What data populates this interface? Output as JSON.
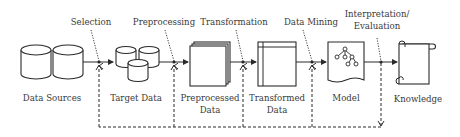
{
  "diagram": {
    "nodes": [
      {
        "id": "data_sources",
        "label": "Data Sources",
        "icon": "databases-icon"
      },
      {
        "id": "target_data",
        "label": "Target Data",
        "icon": "database-cluster-icon"
      },
      {
        "id": "preprocessed_data",
        "label_line1": "Preprocessed",
        "label_line2": "Data",
        "icon": "stacked-pages-icon"
      },
      {
        "id": "transformed_data",
        "label_line1": "Transformed",
        "label_line2": "Data",
        "icon": "table-page-icon"
      },
      {
        "id": "model",
        "label": "Model",
        "icon": "tree-document-icon"
      },
      {
        "id": "knowledge",
        "label": "Knowledge",
        "icon": "scroll-icon"
      }
    ],
    "steps": [
      {
        "id": "selection",
        "label": "Selection"
      },
      {
        "id": "preprocessing",
        "label": "Preprocessing"
      },
      {
        "id": "transformation",
        "label": "Transformation"
      },
      {
        "id": "data_mining",
        "label": "Data Mining"
      },
      {
        "id": "interpretation",
        "label_line1": "Interpretation/",
        "label_line2": "Evaluation"
      }
    ],
    "edges": [
      {
        "from": "data_sources",
        "to": "target_data",
        "via": "selection"
      },
      {
        "from": "target_data",
        "to": "preprocessed_data",
        "via": "preprocessing"
      },
      {
        "from": "preprocessed_data",
        "to": "transformed_data",
        "via": "transformation"
      },
      {
        "from": "transformed_data",
        "to": "model",
        "via": "data_mining"
      },
      {
        "from": "model",
        "to": "knowledge",
        "via": "interpretation"
      }
    ],
    "feedback": {
      "from": "interpretation",
      "to": [
        "selection",
        "preprocessing",
        "transformation",
        "data_mining"
      ],
      "style": "dashed"
    },
    "colors": {
      "line": "#2a2a2a",
      "text": "#3a3a3a",
      "background": "#ffffff"
    }
  }
}
